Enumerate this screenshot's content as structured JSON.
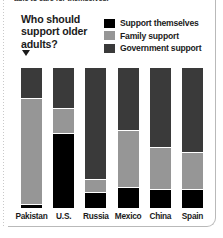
{
  "headline": {
    "clipped_text": "able to care for themselves."
  },
  "question": {
    "text": "Who should support older adults?",
    "pointer_icon": "down-triangle-icon"
  },
  "legend": {
    "position": "top-right",
    "items": [
      {
        "label": "Support themselves",
        "color": "#000000",
        "key": "self"
      },
      {
        "label": "Family support",
        "color": "#969696",
        "key": "family"
      },
      {
        "label": "Government support",
        "color": "#3a3a3a",
        "key": "government"
      }
    ]
  },
  "chart_data": {
    "type": "bar",
    "subtype": "stacked-column-100",
    "title": "Who should support older adults?",
    "xlabel": "",
    "ylabel": "",
    "ylim": [
      0,
      100
    ],
    "grid": false,
    "legend_position": "top-right",
    "categories": [
      "Pakistan",
      "U.S.",
      "Russia",
      "Mexico",
      "China",
      "Spain"
    ],
    "series": [
      {
        "name": "Support themselves",
        "color": "#000000",
        "values": [
          2,
          53,
          11,
          14,
          13,
          13
        ]
      },
      {
        "name": "Family support",
        "color": "#969696",
        "values": [
          76,
          18,
          9,
          41,
          30,
          26
        ]
      },
      {
        "name": "Government support",
        "color": "#3a3a3a",
        "values": [
          22,
          29,
          80,
          45,
          57,
          61
        ]
      }
    ],
    "stack_order_bottom_to_top": [
      "Support themselves",
      "Family support",
      "Government support"
    ],
    "value_unit": "percent"
  }
}
